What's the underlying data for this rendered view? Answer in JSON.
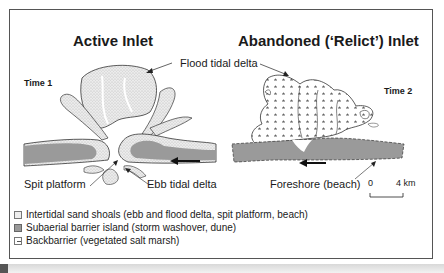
{
  "panels": {
    "left": {
      "title": "Active Inlet",
      "time_label": "Time 1",
      "labels": {
        "spit_platform": "Spit platform",
        "ebb_tidal_delta": "Ebb tidal delta"
      }
    },
    "right": {
      "title": "Abandoned (‘Relict’) Inlet",
      "time_label": "Time 2",
      "labels": {
        "foreshore": "Foreshore (beach)"
      }
    },
    "shared_labels": {
      "flood_tidal_delta": "Flood tidal delta"
    }
  },
  "scale_bar": {
    "start": "0",
    "end": "4 km"
  },
  "legend": {
    "items": [
      {
        "swatch": "stippled-light",
        "label": "Intertidal sand shoals (ebb  and flood delta, spit platform, beach)"
      },
      {
        "swatch": "solid-gray",
        "label": "Subaerial barrier island (storm washover, dune)"
      },
      {
        "swatch": "dash-pattern",
        "label": "Backbarrier (vegetated salt marsh)"
      }
    ]
  },
  "colors": {
    "shoal_fill": "#e6e6e6",
    "barrier_fill": "#9a9a9a",
    "outline": "#333333"
  }
}
